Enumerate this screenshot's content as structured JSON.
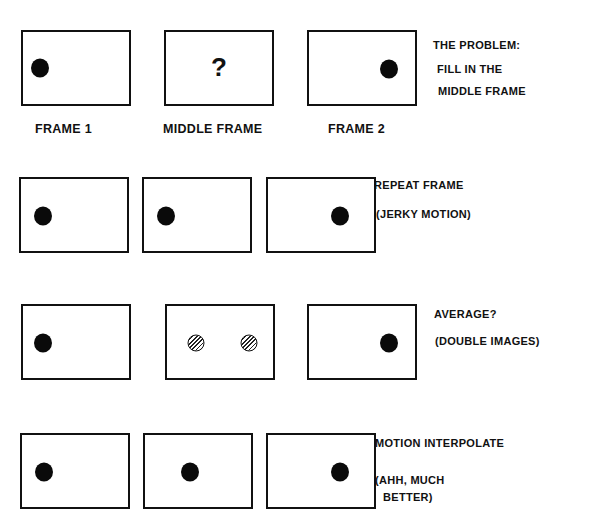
{
  "diagram": {
    "column_labels": [
      "FRAME 1",
      "MIDDLE FRAME",
      "FRAME 2"
    ],
    "rows": [
      {
        "id": "problem",
        "middle_content": "?",
        "notes": [
          "THE PROBLEM:",
          "FILL IN THE",
          "MIDDLE FRAME"
        ]
      },
      {
        "id": "repeat",
        "middle_content": "dot-left",
        "notes": [
          "REPEAT FRAME",
          "(JERKY MOTION)"
        ]
      },
      {
        "id": "average",
        "middle_content": "two-hatched-dots",
        "notes": [
          "AVERAGE?",
          "(DOUBLE IMAGES)"
        ]
      },
      {
        "id": "interpolate",
        "middle_content": "dot-center",
        "notes": [
          "MOTION INTERPOLATE",
          "(AHH, MUCH",
          "BETTER)"
        ]
      }
    ],
    "colors": {
      "ink": "#111111",
      "background": "#ffffff"
    }
  }
}
